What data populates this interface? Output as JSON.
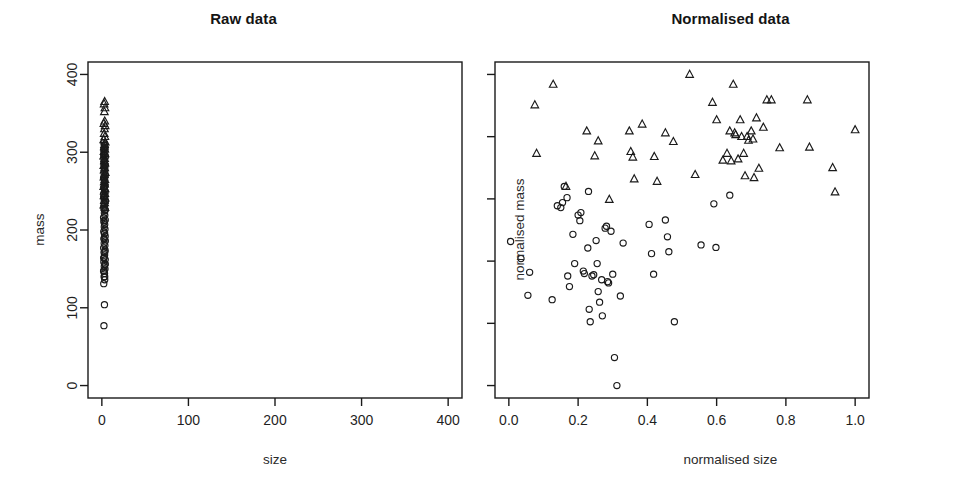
{
  "figure": {
    "background": "#ffffff",
    "foreground": "#1a1a1a",
    "panel_count": 2
  },
  "chart_data": [
    {
      "type": "scatter",
      "panel": "left",
      "title": "Raw data",
      "xlabel": "size",
      "ylabel": "mass",
      "xlim": [
        -16,
        416
      ],
      "ylim": [
        -16,
        416
      ],
      "xticks": [
        0,
        100,
        200,
        300,
        400
      ],
      "yticks": [
        0,
        100,
        200,
        300,
        400
      ],
      "xtick_labels": [
        "0",
        "100",
        "200",
        "300",
        "400"
      ],
      "ytick_labels": [
        "0",
        "100",
        "200",
        "300",
        "400"
      ],
      "grid": false,
      "legend": "none",
      "box": true,
      "note": "All points compressed against the left edge because size spans only 0-8 while mass spans 70-365",
      "series": [
        {
          "name": "circles",
          "marker": "circle",
          "points": [
            [
              2.4,
              77
            ],
            [
              3.0,
              104
            ],
            [
              2.2,
              131
            ],
            [
              3.3,
              136
            ],
            [
              2.6,
              140
            ],
            [
              3.1,
              144
            ],
            [
              2.0,
              147
            ],
            [
              3.6,
              150
            ],
            [
              2.8,
              153
            ],
            [
              3.4,
              156
            ],
            [
              2.3,
              159
            ],
            [
              3.9,
              162
            ],
            [
              2.9,
              165
            ],
            [
              3.2,
              168
            ],
            [
              2.5,
              171
            ],
            [
              3.7,
              174
            ],
            [
              2.1,
              177
            ],
            [
              3.5,
              180
            ],
            [
              2.7,
              183
            ],
            [
              4.0,
              186
            ],
            [
              2.4,
              189
            ],
            [
              3.8,
              192
            ],
            [
              3.0,
              195
            ],
            [
              2.2,
              198
            ],
            [
              3.6,
              201
            ],
            [
              2.8,
              204
            ],
            [
              3.3,
              207
            ],
            [
              2.5,
              210
            ],
            [
              3.9,
              213
            ],
            [
              2.0,
              216
            ],
            [
              3.4,
              219
            ],
            [
              2.9,
              222
            ],
            [
              3.7,
              225
            ],
            [
              2.3,
              228
            ],
            [
              3.1,
              231
            ],
            [
              2.6,
              234
            ],
            [
              4.1,
              237
            ],
            [
              2.7,
              240
            ],
            [
              3.5,
              243
            ],
            [
              2.2,
              246
            ],
            [
              3.8,
              249
            ],
            [
              3.0,
              252
            ],
            [
              2.4,
              255
            ],
            [
              3.6,
              258
            ],
            [
              2.9,
              261
            ],
            [
              3.2,
              264
            ],
            [
              2.1,
              267
            ],
            [
              3.9,
              270
            ],
            [
              2.6,
              273
            ],
            [
              3.4,
              276
            ],
            [
              2.8,
              279
            ],
            [
              3.7,
              282
            ],
            [
              2.3,
              285
            ],
            [
              3.1,
              288
            ],
            [
              2.5,
              291
            ],
            [
              4.0,
              294
            ],
            [
              2.7,
              297
            ],
            [
              3.5,
              300
            ],
            [
              2.2,
              303
            ],
            [
              3.8,
              306
            ],
            [
              3.0,
              309
            ],
            [
              2.4,
              312
            ],
            [
              3.3,
              140
            ],
            [
              2.6,
              148
            ],
            [
              3.9,
              156
            ],
            [
              2.1,
              164
            ],
            [
              3.5,
              172
            ],
            [
              2.8,
              188
            ],
            [
              3.2,
              196
            ],
            [
              2.5,
              212
            ],
            [
              3.7,
              226
            ],
            [
              2.3,
              242
            ],
            [
              3.4,
              256
            ],
            [
              2.9,
              268
            ],
            [
              3.6,
              284
            ],
            [
              2.2,
              296
            ],
            [
              3.1,
              304
            ]
          ]
        },
        {
          "name": "triangles",
          "marker": "triangle",
          "points": [
            [
              3.2,
              365
            ],
            [
              2.6,
              362
            ],
            [
              3.6,
              357
            ],
            [
              2.9,
              352
            ],
            [
              3.3,
              340
            ],
            [
              2.4,
              337
            ],
            [
              3.8,
              334
            ],
            [
              3.0,
              330
            ],
            [
              2.7,
              324
            ],
            [
              3.5,
              320
            ],
            [
              2.2,
              316
            ],
            [
              3.9,
              313
            ],
            [
              3.1,
              310
            ],
            [
              2.8,
              307
            ],
            [
              3.4,
              304
            ],
            [
              2.5,
              301
            ],
            [
              3.7,
              298
            ],
            [
              2.1,
              295
            ],
            [
              3.2,
              292
            ],
            [
              2.9,
              289
            ],
            [
              3.6,
              286
            ],
            [
              2.3,
              283
            ],
            [
              3.3,
              280
            ],
            [
              2.6,
              277
            ],
            [
              3.9,
              274
            ],
            [
              3.0,
              271
            ],
            [
              2.4,
              268
            ],
            [
              3.5,
              265
            ],
            [
              2.8,
              262
            ],
            [
              3.1,
              259
            ],
            [
              2.2,
              256
            ],
            [
              3.7,
              253
            ],
            [
              2.7,
              250
            ],
            [
              3.4,
              247
            ],
            [
              2.5,
              244
            ],
            [
              3.8,
              241
            ],
            [
              2.9,
              238
            ],
            [
              3.2,
              235
            ],
            [
              2.3,
              232
            ],
            [
              3.6,
              229
            ]
          ]
        }
      ]
    },
    {
      "type": "scatter",
      "panel": "right",
      "title": "Normalised data",
      "xlabel": "normalised size",
      "ylabel": "normalised mass",
      "xlim": [
        -0.04,
        1.04
      ],
      "ylim": [
        -0.04,
        1.04
      ],
      "xticks": [
        0.0,
        0.2,
        0.4,
        0.6,
        0.8,
        1.0
      ],
      "yticks": [
        0.0,
        0.2,
        0.4,
        0.6,
        0.8,
        1.0
      ],
      "xtick_labels": [
        "0.0",
        "0.2",
        "0.4",
        "0.6",
        "0.8",
        "1.0"
      ],
      "ytick_labels": [
        "0.0",
        "0.2",
        "0.4",
        "0.6",
        "0.8",
        "1.0"
      ],
      "grid": false,
      "legend": "none",
      "box": true,
      "note": "Triangles occupy the upper band (mass 0.6-1.0); circles occupy the lower band (mass 0.0-0.65)",
      "series": [
        {
          "name": "circles",
          "marker": "circle",
          "points": [
            [
              0.005,
              0.463
            ],
            [
              0.035,
              0.408
            ],
            [
              0.06,
              0.364
            ],
            [
              0.055,
              0.29
            ],
            [
              0.125,
              0.276
            ],
            [
              0.14,
              0.578
            ],
            [
              0.15,
              0.572
            ],
            [
              0.155,
              0.588
            ],
            [
              0.16,
              0.64
            ],
            [
              0.168,
              0.604
            ],
            [
              0.17,
              0.352
            ],
            [
              0.175,
              0.318
            ],
            [
              0.185,
              0.486
            ],
            [
              0.19,
              0.392
            ],
            [
              0.2,
              0.548
            ],
            [
              0.205,
              0.53
            ],
            [
              0.208,
              0.556
            ],
            [
              0.215,
              0.368
            ],
            [
              0.218,
              0.36
            ],
            [
              0.228,
              0.442
            ],
            [
              0.23,
              0.624
            ],
            [
              0.232,
              0.245
            ],
            [
              0.235,
              0.205
            ],
            [
              0.24,
              0.352
            ],
            [
              0.245,
              0.356
            ],
            [
              0.252,
              0.466
            ],
            [
              0.255,
              0.392
            ],
            [
              0.258,
              0.302
            ],
            [
              0.262,
              0.268
            ],
            [
              0.268,
              0.34
            ],
            [
              0.27,
              0.224
            ],
            [
              0.278,
              0.506
            ],
            [
              0.282,
              0.512
            ],
            [
              0.285,
              0.334
            ],
            [
              0.288,
              0.33
            ],
            [
              0.295,
              0.496
            ],
            [
              0.3,
              0.358
            ],
            [
              0.305,
              0.09
            ],
            [
              0.312,
              0.0
            ],
            [
              0.322,
              0.288
            ],
            [
              0.33,
              0.458
            ],
            [
              0.405,
              0.518
            ],
            [
              0.412,
              0.424
            ],
            [
              0.418,
              0.358
            ],
            [
              0.452,
              0.532
            ],
            [
              0.458,
              0.478
            ],
            [
              0.462,
              0.43
            ],
            [
              0.478,
              0.205
            ],
            [
              0.555,
              0.452
            ],
            [
              0.592,
              0.584
            ],
            [
              0.598,
              0.444
            ],
            [
              0.638,
              0.612
            ]
          ]
        },
        {
          "name": "triangles",
          "marker": "triangle",
          "points": [
            [
              0.128,
              0.968
            ],
            [
              0.075,
              0.902
            ],
            [
              0.08,
              0.746
            ],
            [
              0.165,
              0.64
            ],
            [
              0.225,
              0.818
            ],
            [
              0.248,
              0.738
            ],
            [
              0.258,
              0.786
            ],
            [
              0.29,
              0.598
            ],
            [
              0.348,
              0.818
            ],
            [
              0.352,
              0.752
            ],
            [
              0.358,
              0.734
            ],
            [
              0.362,
              0.664
            ],
            [
              0.385,
              0.84
            ],
            [
              0.42,
              0.736
            ],
            [
              0.428,
              0.656
            ],
            [
              0.452,
              0.812
            ],
            [
              0.475,
              0.784
            ],
            [
              0.522,
              1.0
            ],
            [
              0.538,
              0.678
            ],
            [
              0.588,
              0.91
            ],
            [
              0.6,
              0.854
            ],
            [
              0.618,
              0.724
            ],
            [
              0.63,
              0.746
            ],
            [
              0.638,
              0.818
            ],
            [
              0.642,
              0.722
            ],
            [
              0.648,
              0.968
            ],
            [
              0.652,
              0.812
            ],
            [
              0.655,
              0.806
            ],
            [
              0.662,
              0.728
            ],
            [
              0.668,
              0.854
            ],
            [
              0.672,
              0.8
            ],
            [
              0.678,
              0.746
            ],
            [
              0.682,
              0.674
            ],
            [
              0.688,
              0.8
            ],
            [
              0.692,
              0.788
            ],
            [
              0.7,
              0.818
            ],
            [
              0.705,
              0.792
            ],
            [
              0.708,
              0.668
            ],
            [
              0.715,
              0.86
            ],
            [
              0.722,
              0.698
            ],
            [
              0.735,
              0.83
            ],
            [
              0.745,
              0.918
            ],
            [
              0.758,
              0.918
            ],
            [
              0.782,
              0.764
            ],
            [
              0.862,
              0.918
            ],
            [
              0.868,
              0.766
            ],
            [
              0.935,
              0.7
            ],
            [
              0.942,
              0.622
            ],
            [
              1.0,
              0.822
            ]
          ]
        }
      ]
    }
  ]
}
